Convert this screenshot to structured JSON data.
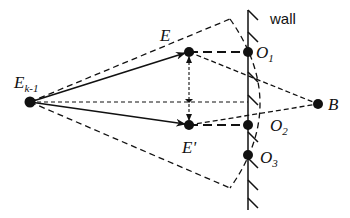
{
  "diagram": {
    "labels": {
      "e_prev_main": "E",
      "e_prev_sub": "k-1",
      "e": "E",
      "e_prime": "E'",
      "o1_main": "O",
      "o1_sub": "1",
      "o2_main": "O",
      "o2_sub": "2",
      "o3_main": "O",
      "o3_sub": "3",
      "b": "B",
      "wall": "wall"
    },
    "nodes": [
      {
        "id": "E_k-1",
        "x": 30,
        "y": 102
      },
      {
        "id": "E",
        "x": 189,
        "y": 52
      },
      {
        "id": "E'",
        "x": 189,
        "y": 125
      },
      {
        "id": "O1",
        "x": 248,
        "y": 52
      },
      {
        "id": "O2",
        "x": 248,
        "y": 125
      },
      {
        "id": "O3",
        "x": 248,
        "y": 155
      },
      {
        "id": "B",
        "x": 318,
        "y": 104
      }
    ],
    "colors": {
      "stroke": "#111111",
      "background": "#ffffff"
    }
  }
}
